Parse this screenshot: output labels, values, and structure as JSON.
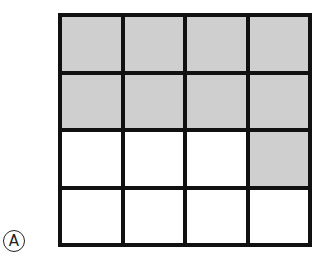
{
  "label": "A",
  "grid": {
    "rows": 4,
    "cols": 4,
    "cells": [
      [
        true,
        true,
        true,
        true
      ],
      [
        true,
        true,
        true,
        true
      ],
      [
        false,
        false,
        false,
        true
      ],
      [
        false,
        false,
        false,
        false
      ]
    ],
    "shaded_count": 9,
    "total_count": 16,
    "shade_color": "#cfcfcf",
    "line_color": "#111111"
  }
}
